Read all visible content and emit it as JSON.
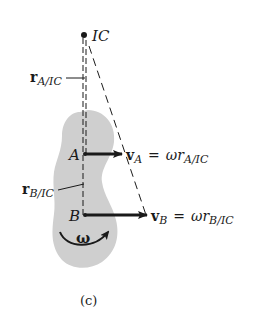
{
  "figure": {
    "caption": "(c)",
    "colors": {
      "body_fill": "#cfcfcf",
      "ink": "#1a1a1a",
      "background": "#ffffff"
    }
  },
  "points": {
    "ic": {
      "label": "IC",
      "x": 84,
      "y": 35
    },
    "a": {
      "label": "A",
      "x": 85,
      "y": 154
    },
    "b": {
      "label": "B",
      "x": 85,
      "y": 215
    }
  },
  "position_vectors": {
    "r_a": {
      "symbol": "r",
      "subscript": "A/IC"
    },
    "r_b": {
      "symbol": "r",
      "subscript": "B/IC"
    }
  },
  "velocity_vectors": {
    "v_a": {
      "symbol": "v",
      "subscript": "A",
      "equals": "=",
      "omega": "ω",
      "r_symbol": "r",
      "r_subscript": "A/IC"
    },
    "v_b": {
      "symbol": "v",
      "subscript": "B",
      "equals": "=",
      "omega": "ω",
      "r_symbol": "r",
      "r_subscript": "B/IC"
    }
  },
  "angular_velocity": {
    "symbol": "ω",
    "direction": "counterclockwise arrow"
  }
}
